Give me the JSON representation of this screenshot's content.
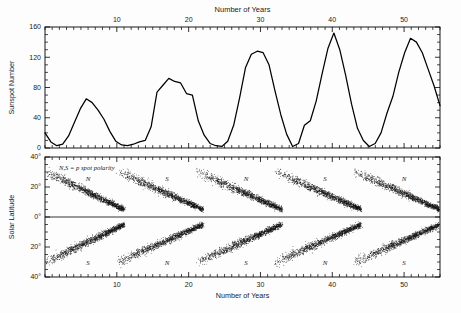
{
  "figure": {
    "top_title": "Number of Years",
    "bottom_title": "Number of Years"
  },
  "chart_data": [
    {
      "type": "line",
      "title": "Number of Years",
      "xlabel": "Number of Years",
      "ylabel": "Sunspot Number",
      "xlim": [
        0,
        55
      ],
      "ylim": [
        0,
        160
      ],
      "xticks": [
        10,
        20,
        30,
        40,
        50
      ],
      "yticks": [
        0,
        40,
        80,
        120,
        160
      ],
      "grid": false,
      "legend": "none",
      "x": [
        0,
        1,
        2,
        3,
        4,
        5,
        6,
        7,
        8,
        9,
        10,
        11,
        12,
        13,
        14,
        15,
        16,
        17,
        18,
        19,
        20,
        21,
        22,
        23,
        24,
        25,
        26,
        27,
        28,
        29,
        30,
        31,
        32,
        33,
        34,
        35,
        36,
        37,
        38,
        39,
        40,
        41,
        42,
        43,
        44,
        45,
        46,
        47,
        48,
        49,
        50,
        51,
        52,
        53,
        54,
        55
      ],
      "values": [
        20,
        8,
        3,
        5,
        16,
        34,
        52,
        65,
        60,
        50,
        38,
        22,
        9,
        4,
        3,
        5,
        8,
        10,
        28,
        74,
        83,
        92,
        88,
        86,
        72,
        70,
        36,
        17,
        6,
        3,
        2,
        9,
        30,
        66,
        106,
        124,
        128,
        126,
        110,
        76,
        44,
        18,
        2,
        6,
        30,
        36,
        62,
        98,
        132,
        152,
        130,
        96,
        58,
        26,
        10,
        2,
        6,
        20,
        46,
        68,
        100,
        126,
        145,
        140,
        126,
        104,
        82,
        56
      ]
    },
    {
      "type": "scatter",
      "title": "Butterfly Diagram",
      "xlabel": "Number of Years",
      "ylabel": "Solar Latitude",
      "xlim": [
        0,
        55
      ],
      "ylim": [
        -40,
        40
      ],
      "xticks": [
        10,
        20,
        30,
        40,
        50
      ],
      "ytick_labels": [
        "40°",
        "20°",
        "0°",
        "20°",
        "40°"
      ],
      "ytick_values": [
        40,
        20,
        0,
        -20,
        -40
      ],
      "grid": false,
      "legend": "none",
      "annotation": "N,S = p spot polarity",
      "cycles": [
        {
          "start": 0,
          "end": 11,
          "north_label": "N",
          "south_label": "S",
          "label_x": 6
        },
        {
          "start": 10,
          "end": 22,
          "north_label": "S",
          "south_label": "N",
          "label_x": 17
        },
        {
          "start": 21,
          "end": 33,
          "north_label": "N",
          "south_label": "S",
          "label_x": 28
        },
        {
          "start": 32,
          "end": 44,
          "north_label": "S",
          "south_label": "N",
          "label_x": 39
        },
        {
          "start": 43,
          "end": 55,
          "north_label": "N",
          "south_label": "S",
          "label_x": 50
        }
      ]
    }
  ],
  "top_panel": {
    "y_axis_label": "Sunspot Number",
    "x_tick_labels": [
      "10",
      "20",
      "30",
      "40",
      "50"
    ],
    "y_tick_labels": [
      "0",
      "40",
      "80",
      "120",
      "160"
    ],
    "title": "Number of Years"
  },
  "bottom_panel": {
    "y_axis_label": "Solar Latitude",
    "x_axis_label": "Number of Years",
    "x_tick_labels": [
      "10",
      "20",
      "30",
      "40",
      "50"
    ],
    "y_tick_labels": [
      "40°",
      "20°",
      "0°",
      "20°",
      "40°"
    ],
    "note": "N,S = p spot polarity",
    "north_polarity_labels": [
      "N",
      "S",
      "N",
      "S",
      "N"
    ],
    "south_polarity_labels": [
      "S",
      "N",
      "S",
      "N",
      "S"
    ]
  },
  "colors": {
    "ink": "#000000",
    "background": "#ffffff"
  }
}
